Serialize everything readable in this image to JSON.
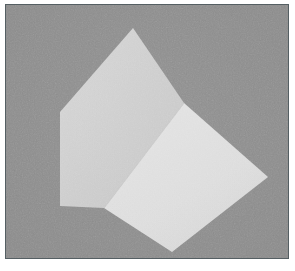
{
  "figure": {
    "kind": "rendered-3d-shape",
    "caption": "",
    "canvas": {
      "width": 295,
      "height": 271
    },
    "frame": {
      "border_color": "#555f63",
      "border_width": 1,
      "margin_color": "#ffffff",
      "inner_left": 5,
      "inner_top": 4,
      "inner_width": 284,
      "inner_height": 255
    },
    "background": {
      "label": "flat gray backdrop",
      "color": "#8b8b8b",
      "grain": "film-grain"
    },
    "faces": [
      {
        "id": "face-top-left",
        "label": "upper-left face",
        "fill": "#cdcdcd",
        "shade": "mid-light",
        "points": "127,23 178,98 98,203 54,201 54,107"
      },
      {
        "id": "face-lower-right",
        "label": "lower-right face",
        "fill": "#dddddd",
        "shade": "brightest",
        "points": "178,98 262,172 166,247 98,203"
      }
    ],
    "vertices": [
      {
        "id": "apex",
        "label": "top apex",
        "x": 127,
        "y": 23
      },
      {
        "id": "left-upper",
        "label": "upper-left corner",
        "x": 54,
        "y": 107
      },
      {
        "id": "left-lower",
        "label": "lower-left corner",
        "x": 54,
        "y": 201
      },
      {
        "id": "center-right",
        "label": "middle-right corner",
        "x": 178,
        "y": 98
      },
      {
        "id": "right",
        "label": "right corner",
        "x": 262,
        "y": 172
      },
      {
        "id": "bottom",
        "label": "bottom corner",
        "x": 166,
        "y": 247
      },
      {
        "id": "center",
        "label": "inner junction",
        "x": 98,
        "y": 203
      }
    ],
    "edges": [
      {
        "id": "edge-silhouette",
        "label": "outer silhouette",
        "color": "#c9c9c9"
      },
      {
        "id": "edge-internal",
        "label": "internal ridge between faces",
        "color": "#cacaca"
      }
    ],
    "palette": {
      "background_gray": "#8b8b8b",
      "face_light": "#cdcdcd",
      "face_lighter": "#dddddd",
      "frame_line": "#555f63",
      "page_white": "#ffffff"
    }
  }
}
